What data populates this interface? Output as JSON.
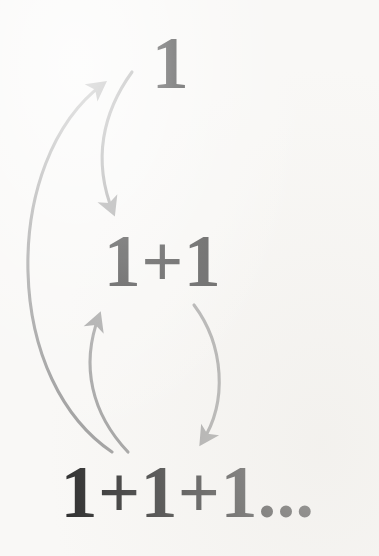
{
  "canvas": {
    "width": 379,
    "height": 556,
    "background_color": "#f9f8f6"
  },
  "colors": {
    "text": "#2d2d2d",
    "arrow": "#9b9b9b",
    "background": "#f9f8f6"
  },
  "diagram": {
    "type": "recursive-sequence-diagram",
    "levels": [
      {
        "id": "level-1",
        "label": "1",
        "term_count": 1
      },
      {
        "id": "level-2",
        "label": "1+1",
        "term_count": 2
      },
      {
        "id": "level-3",
        "label": "1+1+1...",
        "term_count": 3,
        "has_ellipsis": true
      }
    ],
    "arrows": [
      {
        "id": "arrow-up-long",
        "from": "level-3",
        "to": "level-1",
        "direction": "up",
        "shape": "long-left-bowed-curve",
        "color": "#9b9b9b"
      },
      {
        "id": "arrow-down-upper",
        "from": "level-1",
        "to": "level-2",
        "direction": "down",
        "shape": "short-left-bowed-curve",
        "color": "#9b9b9b"
      },
      {
        "id": "arrow-up-lower",
        "from": "level-3",
        "to": "level-2",
        "direction": "up",
        "shape": "left-bowed-loop-curve",
        "color": "#9b9b9b"
      },
      {
        "id": "arrow-down-lower",
        "from": "level-2",
        "to": "level-3",
        "direction": "down",
        "shape": "right-bowed-loop-curve",
        "color": "#9b9b9b"
      }
    ]
  }
}
